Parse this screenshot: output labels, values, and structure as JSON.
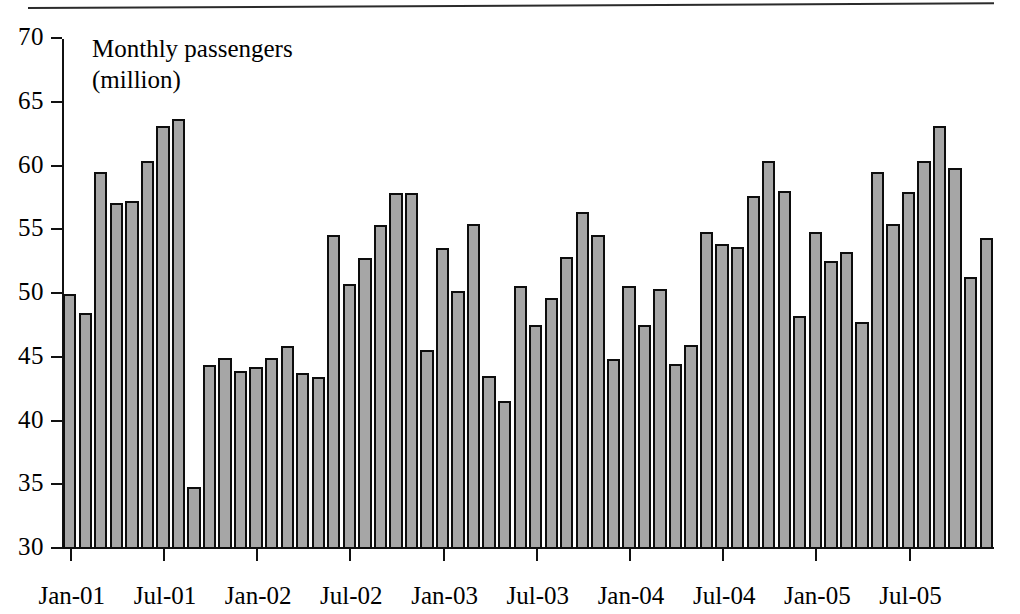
{
  "figure": {
    "annotation_line1": "Monthly passengers",
    "annotation_line2": "(million)",
    "bar_fill_color": "#a6a6a6",
    "bar_border_color": "#0d0d0d",
    "axis_color": "#111111"
  },
  "chart_data": {
    "type": "bar",
    "title": "",
    "subtitle": "",
    "annotation": "Monthly passengers (million)",
    "xlabel": "",
    "ylabel": "Monthly passengers (million)",
    "ylim": [
      30,
      70
    ],
    "yticks": [
      30,
      35,
      40,
      45,
      50,
      55,
      60,
      65,
      70
    ],
    "ytick_labels": [
      "30",
      "35",
      "40",
      "45",
      "50",
      "55",
      "60",
      "65",
      "70"
    ],
    "grid": false,
    "legend": null,
    "xtick_labels": [
      "Jan-01",
      "Jul-01",
      "Jan-02",
      "Jul-02",
      "Jan-03",
      "Jul-03",
      "Jan-04",
      "Jul-04",
      "Jan-05",
      "Jul-05"
    ],
    "xtick_indices": [
      0,
      6,
      12,
      18,
      24,
      30,
      36,
      42,
      48,
      54
    ],
    "categories": [
      "Jan-01",
      "Feb-01",
      "Mar-01",
      "Apr-01",
      "May-01",
      "Jun-01",
      "Jul-01",
      "Aug-01",
      "Sep-01",
      "Oct-01",
      "Nov-01",
      "Dec-01",
      "Jan-02",
      "Feb-02",
      "Mar-02",
      "Apr-02",
      "May-02",
      "Jun-02",
      "Jul-02",
      "Aug-02",
      "Sep-02",
      "Oct-02",
      "Nov-02",
      "Dec-02",
      "Jan-03",
      "Feb-03",
      "Mar-03",
      "Apr-03",
      "May-03",
      "Jun-03",
      "Jul-03",
      "Aug-03",
      "Sep-03",
      "Oct-03",
      "Nov-03",
      "Dec-03",
      "Jan-04",
      "Feb-04",
      "Mar-04",
      "Apr-04",
      "May-04",
      "Jun-04",
      "Jul-04",
      "Aug-04",
      "Sep-04",
      "Oct-04",
      "Nov-04",
      "Dec-04",
      "Jan-05",
      "Feb-05",
      "Mar-05",
      "Apr-05",
      "May-05",
      "Jun-05",
      "Jul-05",
      "Aug-05",
      "Sep-05",
      "Oct-05",
      "Nov-05",
      "Dec-05"
    ],
    "values": [
      50.0,
      48.5,
      59.6,
      57.1,
      57.3,
      60.4,
      63.2,
      63.7,
      34.9,
      44.4,
      45.0,
      44.0,
      44.3,
      45.0,
      45.9,
      43.8,
      43.5,
      54.6,
      50.8,
      52.8,
      55.4,
      57.9,
      57.9,
      45.6,
      53.6,
      50.2,
      55.5,
      43.6,
      41.6,
      50.6,
      47.6,
      49.7,
      52.9,
      56.4,
      54.6,
      44.9,
      50.6,
      47.6,
      50.4,
      44.5,
      46.0,
      54.9,
      53.9,
      53.7,
      57.7,
      60.4,
      58.1,
      48.3,
      54.9,
      52.6,
      53.3,
      47.8,
      59.6,
      55.5,
      58.0,
      60.4,
      63.2,
      59.9,
      51.3,
      54.4
    ],
    "extra_values_note": ""
  }
}
